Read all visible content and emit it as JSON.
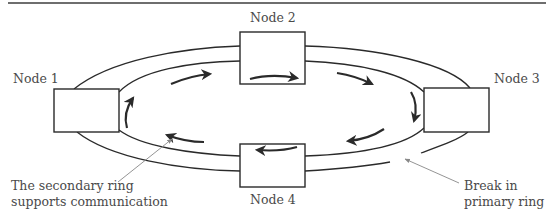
{
  "diagram": {
    "type": "dual-ring-network",
    "nodes": [
      {
        "id": "node1",
        "label": "Node 1"
      },
      {
        "id": "node2",
        "label": "Node 2"
      },
      {
        "id": "node3",
        "label": "Node 3"
      },
      {
        "id": "node4",
        "label": "Node 4"
      }
    ],
    "annotations": {
      "secondary_line1": "The secondary ring",
      "secondary_line2": "supports communication",
      "break_line1": "Break in",
      "break_line2": "primary ring"
    },
    "colors": {
      "line": "#2a2a2a",
      "text": "#4a4a4a",
      "pointer": "#777777"
    }
  }
}
